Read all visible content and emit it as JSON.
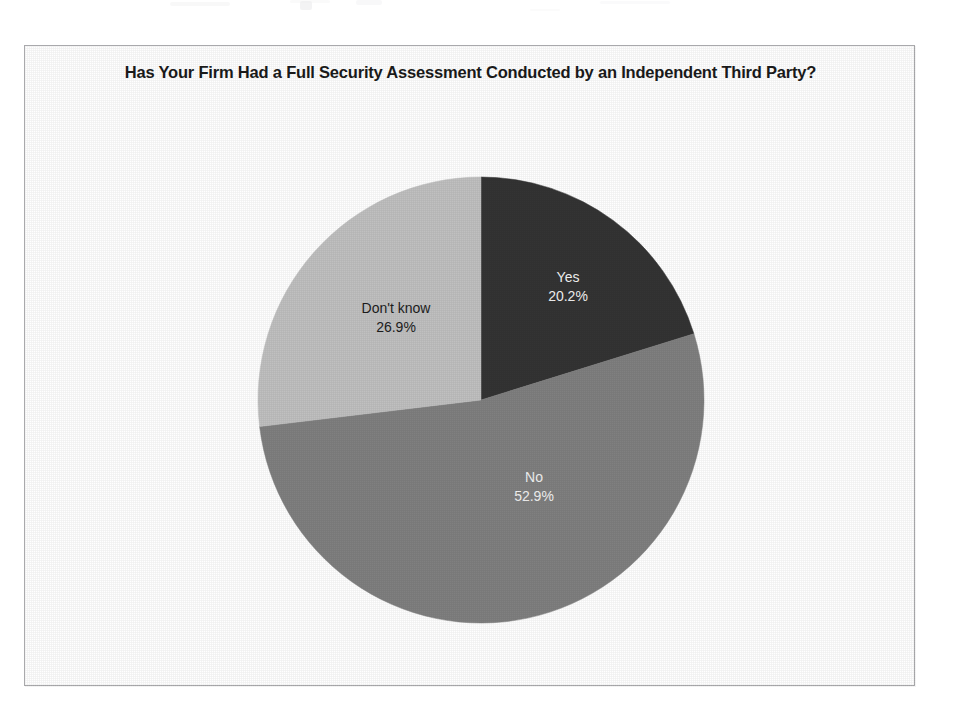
{
  "figure": {
    "background_color": "#ffffff",
    "border_color": "#a9a9ac"
  },
  "chart_data": {
    "type": "pie",
    "title": "Has Your Firm Had a Full Security Assessment Conducted by an Independent Third Party?",
    "title_line_1": "Has Your Firm Had a Full Security Assessment Conducted by an Independent",
    "title_line_2": "Third Party?",
    "xlabel": "",
    "ylabel": "",
    "legend": "none",
    "grid": false,
    "labels_inside_slices": true,
    "start_angle_deg": 90,
    "direction": "clockwise",
    "categories": [
      "Yes",
      "No",
      "Don't know"
    ],
    "values": [
      20.2,
      52.9,
      26.9
    ],
    "value_unit": "%",
    "value_labels": [
      "20.2%",
      "52.9%",
      "26.9%"
    ],
    "colors": [
      "#343434",
      "#808080",
      "#c0c0c0"
    ],
    "slices": [
      {
        "name": "Yes",
        "value": 20.2,
        "value_label": "20.2%",
        "color": "#343434",
        "label_text_color": "#f3f3f3",
        "start_deg": 0.0,
        "end_deg": 72.72
      },
      {
        "name": "No",
        "value": 52.9,
        "value_label": "52.9%",
        "color": "#808080",
        "label_text_color": "#f2f2f2",
        "start_deg": 72.72,
        "end_deg": 263.16
      },
      {
        "name": "Don't know",
        "value": 26.9,
        "value_label": "26.9%",
        "color": "#c0c0c0",
        "label_text_color": "#1d1d1d",
        "start_deg": 263.16,
        "end_deg": 360.0
      }
    ]
  }
}
